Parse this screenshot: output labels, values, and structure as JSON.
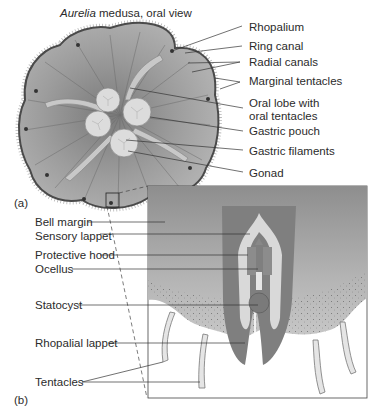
{
  "figure": {
    "title_italic": "Aurelia",
    "title_rest": " medusa, oral view",
    "panel_a_label": "(a)",
    "panel_b_label": "(b)"
  },
  "labels_a": [
    {
      "id": "rhopalium",
      "text": "Rhopalium"
    },
    {
      "id": "ring-canal",
      "text": "Ring canal"
    },
    {
      "id": "radial-canals",
      "text": "Radial canals"
    },
    {
      "id": "marginal-tentacles",
      "text": "Marginal tentacles"
    },
    {
      "id": "oral-lobe",
      "text": "Oral lobe with"
    },
    {
      "id": "oral-lobe-2",
      "text": "oral tentacles"
    },
    {
      "id": "gastric-pouch",
      "text": "Gastric pouch"
    },
    {
      "id": "gastric-filaments",
      "text": "Gastric filaments"
    },
    {
      "id": "gonad",
      "text": "Gonad"
    }
  ],
  "labels_b": [
    {
      "id": "bell-margin",
      "text": "Bell margin"
    },
    {
      "id": "sensory-lappet",
      "text": "Sensory lappet"
    },
    {
      "id": "protective-hood",
      "text": "Protective hood"
    },
    {
      "id": "ocellus",
      "text": "Ocellus"
    },
    {
      "id": "statocyst",
      "text": "Statocyst"
    },
    {
      "id": "rhopalial-lappet",
      "text": "Rhopalial lappet"
    },
    {
      "id": "tentacles",
      "text": "Tentacles"
    }
  ],
  "colors": {
    "bell_fill": "#9a9a9a",
    "bell_edge": "#4a4a4a",
    "lobe_fill": "#dcdcdc",
    "inset_bg": "#a8a8a8",
    "lappet": "#7f7f7f",
    "light": "#d9d9d9"
  }
}
